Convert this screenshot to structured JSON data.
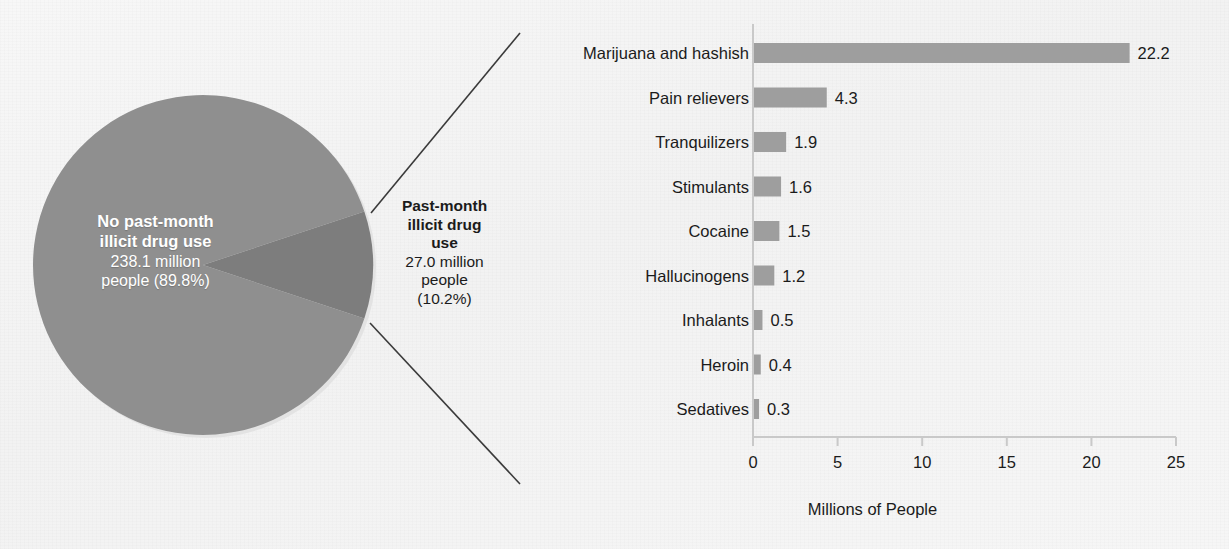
{
  "figure": {
    "background_color": "#f5f5f5",
    "pie_color": "#8f8f8f",
    "slice_color": "#7d7d7d",
    "bar_color": "#9e9e9e",
    "axis_color": "#c9c9c9",
    "text_color": "#1b1b1b",
    "leader_line_color": "#3a3a3a"
  },
  "pie": {
    "major": {
      "title_line1": "No past-month",
      "title_line2": "illicit drug use",
      "value_line1": "238.1 million",
      "value_line2": "people (89.8%)"
    },
    "minor": {
      "title_line1": "Past-month",
      "title_line2": "illicit drug",
      "title_line3": "use",
      "value_line1": "27.0 million",
      "value_line2": "people",
      "value_line3": "(10.2%)"
    }
  },
  "chart_data": {
    "type": "pie",
    "title": "",
    "labels": [
      "No past-month illicit drug use",
      "Past-month illicit drug use"
    ],
    "values": [
      238.1,
      27.0
    ],
    "percentages": [
      89.8,
      10.2
    ],
    "unit": "million people"
  },
  "bar_chart": {
    "xlabel": "Millions of People",
    "ticks": [
      "0",
      "5",
      "10",
      "15",
      "20",
      "25"
    ],
    "categories": [
      "Marijuana and hashish",
      "Pain relievers",
      "Tranquilizers",
      "Stimulants",
      "Cocaine",
      "Hallucinogens",
      "Inhalants",
      "Heroin",
      "Sedatives"
    ],
    "value_labels": [
      "22.2",
      "4.3",
      "1.9",
      "1.6",
      "1.5",
      "1.2",
      "0.5",
      "0.4",
      "0.3"
    ]
  },
  "bar_chart_data": {
    "type": "bar",
    "orientation": "horizontal",
    "title": "",
    "xlabel": "Millions of People",
    "ylabel": "",
    "xlim": [
      0,
      25
    ],
    "xticks": [
      0,
      5,
      10,
      15,
      20,
      25
    ],
    "grid": false,
    "legend": "none",
    "categories": [
      "Marijuana and hashish",
      "Pain relievers",
      "Tranquilizers",
      "Stimulants",
      "Cocaine",
      "Hallucinogens",
      "Inhalants",
      "Heroin",
      "Sedatives"
    ],
    "values": [
      22.2,
      4.3,
      1.9,
      1.6,
      1.5,
      1.2,
      0.5,
      0.4,
      0.3
    ]
  }
}
